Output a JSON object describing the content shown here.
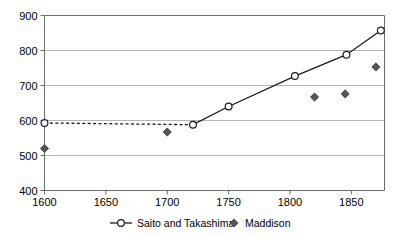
{
  "chart_data": {
    "type": "scatter",
    "title": "",
    "subtitle": "",
    "xlabel": "",
    "ylabel": "",
    "xlim": [
      1600,
      1877
    ],
    "ylim": [
      400,
      900
    ],
    "xticks": [
      1600,
      1650,
      1700,
      1750,
      1800,
      1850
    ],
    "xtick_labels": [
      "1600",
      "1650",
      "1700",
      "1750",
      "1800",
      "1850"
    ],
    "yticks": [
      400,
      500,
      600,
      700,
      800,
      900
    ],
    "ytick_labels": [
      "400",
      "500",
      "600",
      "700",
      "800",
      "900"
    ],
    "grid": "horizontal",
    "legend_position": "bottom",
    "series": [
      {
        "name": "Saito and Takashima",
        "marker": "open-circle",
        "style": "line-with-markers",
        "color": "#000000",
        "segments": [
          {
            "dash": "dotted",
            "from_index": 0,
            "to_index": 1
          },
          {
            "dash": "solid",
            "from_index": 1,
            "to_index": 5
          }
        ],
        "points": [
          {
            "x": 1600,
            "y": 593
          },
          {
            "x": 1721,
            "y": 588
          },
          {
            "x": 1750,
            "y": 640
          },
          {
            "x": 1804,
            "y": 727
          },
          {
            "x": 1846,
            "y": 788
          },
          {
            "x": 1874,
            "y": 857
          }
        ]
      },
      {
        "name": "Maddison",
        "marker": "filled-diamond",
        "style": "markers-only",
        "color": "#555555",
        "points": [
          {
            "x": 1600,
            "y": 520
          },
          {
            "x": 1700,
            "y": 567
          },
          {
            "x": 1820,
            "y": 667
          },
          {
            "x": 1845,
            "y": 676
          },
          {
            "x": 1870,
            "y": 753
          }
        ]
      }
    ],
    "colors": {
      "axis": "#6d6d6d",
      "grid": "#b5b5b5",
      "line": "#1a1a1a",
      "marker_fill": "#ffffff",
      "diamond_fill": "#555555",
      "background": "#ffffff"
    }
  },
  "legend": {
    "entries": [
      {
        "label": "Saito and Takashima",
        "marker": "line-open-circle"
      },
      {
        "label": "Maddison",
        "marker": "filled-diamond"
      }
    ]
  }
}
